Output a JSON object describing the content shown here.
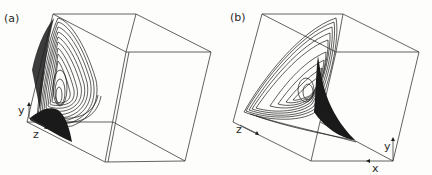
{
  "figure": {
    "panels": [
      {
        "id": "a",
        "label": "(a)",
        "axes": {
          "y": "y",
          "z": "z"
        },
        "description": "Strange attractor trajectory projected inside a perspective cube, viewed with y up and z to the right"
      },
      {
        "id": "b",
        "label": "(b)",
        "axes": {
          "x": "x",
          "y": "y",
          "z": "z"
        },
        "description": "Same attractor from a rotated viewpoint showing sheet-like folded structure"
      }
    ],
    "colors": {
      "ink": "#1a1a1a",
      "edges": "#3a3a3a",
      "background": "#fdfdfb"
    }
  }
}
